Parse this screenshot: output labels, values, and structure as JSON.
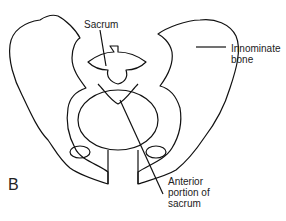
{
  "figure": {
    "panel_label": "B",
    "labels": {
      "sacrum": "Sacrum",
      "innominate_line1": "Innominate",
      "innominate_line2": "bone",
      "anterior_line1": "Anterior",
      "anterior_line2": "portion of",
      "anterior_line3": "sacrum"
    }
  }
}
